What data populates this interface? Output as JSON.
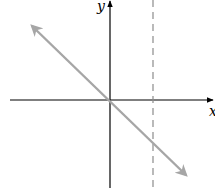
{
  "diagram": {
    "type": "coordinate-plane",
    "axes": {
      "x_label": "x",
      "y_label": "y"
    },
    "elements": [
      {
        "kind": "line",
        "description": "line through origin with negative slope, arrows at both ends",
        "color": "#a6a6a6"
      },
      {
        "kind": "vertical-dashed-line",
        "description": "dashed vertical line to the right of the y-axis",
        "color": "#8c8c8c"
      }
    ],
    "colors": {
      "axes": "#000000",
      "line": "#a6a6a6",
      "dashed": "#8c8c8c"
    }
  }
}
